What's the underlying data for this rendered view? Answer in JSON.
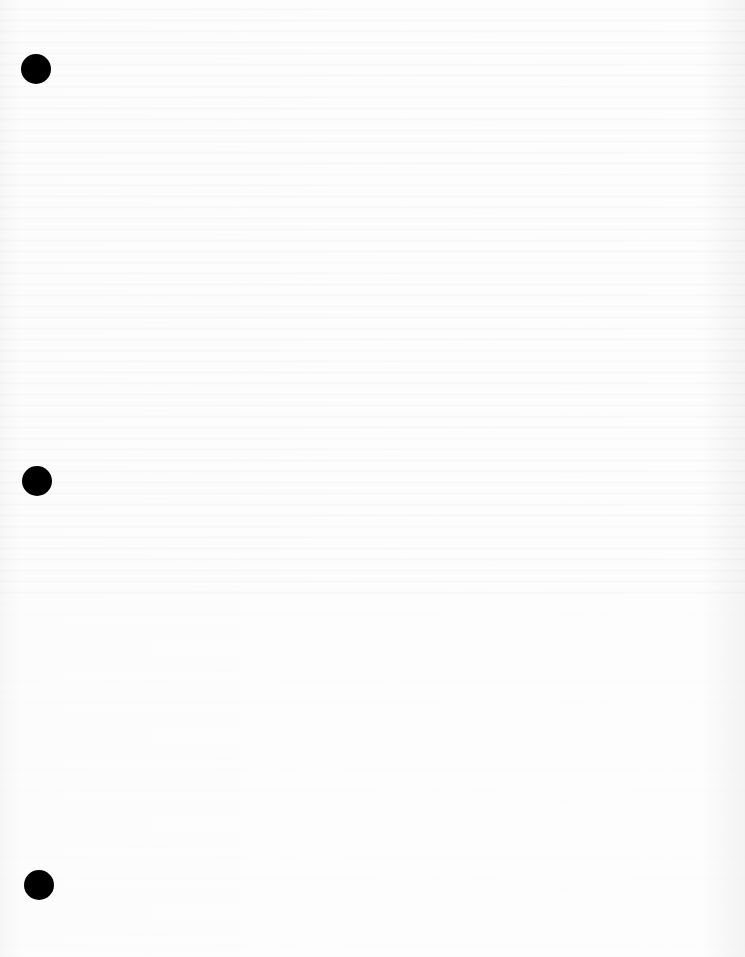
{
  "page": {
    "type": "blank-punched-sheet",
    "background_color": "#fbfbfb",
    "punch_holes": [
      {
        "cx": 36,
        "cy": 69,
        "diameter": 30,
        "color": "#000000"
      },
      {
        "cx": 37,
        "cy": 481,
        "diameter": 30,
        "color": "#000000"
      },
      {
        "cx": 39,
        "cy": 885,
        "diameter": 30,
        "color": "#000000"
      }
    ]
  }
}
